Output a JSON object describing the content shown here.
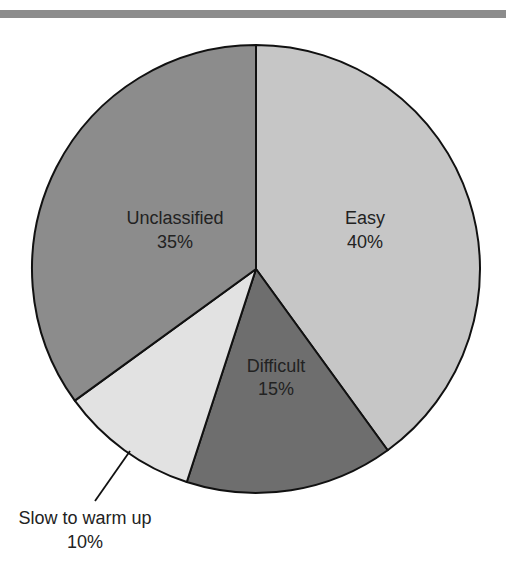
{
  "header": {
    "rule_color": "#8c8c8c"
  },
  "chart_data": {
    "type": "pie",
    "title": "",
    "start_angle_deg": 0,
    "direction": "clockwise",
    "slices": [
      {
        "label": "Easy",
        "value": 40,
        "pct_label": "40%",
        "color": "#c6c6c6"
      },
      {
        "label": "Difficult",
        "value": 15,
        "pct_label": "15%",
        "color": "#6e6e6e"
      },
      {
        "label": "Slow to warm up",
        "value": 10,
        "pct_label": "10%",
        "color": "#e2e2e2"
      },
      {
        "label": "Unclassified",
        "value": 35,
        "pct_label": "35%",
        "color": "#8c8c8c"
      }
    ],
    "categories": [
      "Easy",
      "Difficult",
      "Slow to warm up",
      "Unclassified"
    ],
    "values": [
      40,
      15,
      10,
      35
    ],
    "legend": "none",
    "annotations": [
      {
        "slice": "Slow to warm up",
        "type": "leader-line",
        "position": "outside-bottom-left"
      }
    ]
  }
}
